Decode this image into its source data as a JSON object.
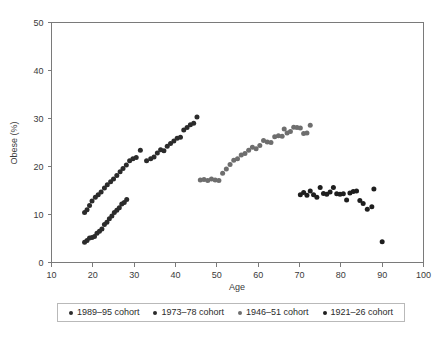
{
  "chart_data": {
    "type": "scatter",
    "title": "",
    "xlabel": "Age",
    "ylabel": "Obese (%)",
    "xlim": [
      10,
      100
    ],
    "ylim": [
      0,
      50
    ],
    "xticks": [
      10,
      20,
      30,
      40,
      50,
      60,
      70,
      80,
      90,
      100
    ],
    "yticks": [
      0,
      10,
      20,
      30,
      40,
      50
    ],
    "grid": false,
    "legend_position": "bottom",
    "series": [
      {
        "name": "1989–95 cohort",
        "color": "#2b2b2b",
        "points": [
          [
            18.0,
            4.2
          ],
          [
            18.6,
            4.6
          ],
          [
            19.2,
            5.1
          ],
          [
            19.8,
            5.2
          ],
          [
            20.4,
            5.4
          ],
          [
            21.0,
            6.1
          ],
          [
            21.6,
            6.5
          ],
          [
            22.2,
            7.0
          ],
          [
            22.8,
            7.9
          ],
          [
            23.4,
            8.4
          ],
          [
            24.0,
            9.1
          ],
          [
            24.6,
            9.7
          ],
          [
            25.2,
            10.4
          ],
          [
            25.8,
            10.9
          ],
          [
            26.4,
            11.4
          ],
          [
            27.0,
            12.2
          ],
          [
            27.6,
            12.5
          ],
          [
            28.2,
            13.1
          ]
        ]
      },
      {
        "name": "1973–78 cohort",
        "color": "#2b2b2b",
        "points": [
          [
            18.0,
            10.4
          ],
          [
            18.6,
            11.0
          ],
          [
            19.2,
            11.9
          ],
          [
            19.8,
            12.8
          ],
          [
            20.6,
            13.6
          ],
          [
            21.3,
            14.1
          ],
          [
            22.0,
            14.7
          ],
          [
            22.8,
            15.5
          ],
          [
            23.5,
            16.2
          ],
          [
            24.3,
            16.8
          ],
          [
            25.0,
            17.4
          ],
          [
            25.8,
            18.1
          ],
          [
            26.6,
            18.9
          ],
          [
            27.3,
            19.6
          ],
          [
            28.1,
            20.3
          ],
          [
            28.9,
            21.2
          ],
          [
            29.7,
            21.6
          ],
          [
            30.5,
            21.9
          ],
          [
            31.5,
            23.4
          ],
          [
            33.0,
            21.2
          ],
          [
            34.0,
            21.6
          ],
          [
            34.8,
            22.0
          ],
          [
            35.6,
            22.8
          ],
          [
            36.4,
            23.5
          ],
          [
            37.2,
            23.3
          ],
          [
            38.0,
            24.2
          ],
          [
            38.8,
            24.8
          ],
          [
            39.6,
            25.3
          ],
          [
            40.4,
            25.9
          ],
          [
            41.2,
            26.1
          ],
          [
            42.0,
            27.6
          ],
          [
            42.8,
            28.1
          ],
          [
            43.6,
            28.7
          ],
          [
            44.4,
            29.0
          ],
          [
            45.2,
            30.3
          ]
        ]
      },
      {
        "name": "1946–51 cohort",
        "color": "#6e6e6e",
        "points": [
          [
            46.0,
            17.2
          ],
          [
            46.9,
            17.3
          ],
          [
            47.8,
            17.1
          ],
          [
            48.7,
            17.4
          ],
          [
            49.6,
            17.2
          ],
          [
            50.5,
            17.1
          ],
          [
            51.4,
            18.6
          ],
          [
            52.3,
            19.5
          ],
          [
            53.2,
            20.4
          ],
          [
            54.1,
            21.3
          ],
          [
            55.0,
            21.6
          ],
          [
            55.9,
            22.4
          ],
          [
            56.8,
            22.7
          ],
          [
            57.7,
            23.4
          ],
          [
            58.6,
            24.0
          ],
          [
            59.5,
            23.7
          ],
          [
            60.4,
            24.4
          ],
          [
            61.3,
            25.4
          ],
          [
            62.2,
            25.1
          ],
          [
            63.1,
            25.0
          ],
          [
            64.0,
            26.2
          ],
          [
            64.9,
            26.4
          ],
          [
            65.8,
            26.3
          ],
          [
            66.3,
            27.8
          ],
          [
            67.0,
            27.0
          ],
          [
            67.8,
            27.3
          ],
          [
            68.6,
            28.2
          ],
          [
            69.4,
            28.1
          ],
          [
            70.2,
            28.0
          ],
          [
            71.0,
            26.9
          ],
          [
            71.8,
            27.0
          ],
          [
            72.6,
            28.6
          ]
        ]
      },
      {
        "name": "1921–26 cohort",
        "color": "#1e1e1e",
        "points": [
          [
            70.2,
            14.1
          ],
          [
            71.0,
            14.6
          ],
          [
            71.8,
            14.0
          ],
          [
            72.6,
            14.9
          ],
          [
            73.4,
            14.1
          ],
          [
            74.2,
            13.6
          ],
          [
            75.0,
            15.6
          ],
          [
            75.8,
            14.4
          ],
          [
            76.6,
            14.2
          ],
          [
            77.4,
            14.7
          ],
          [
            78.2,
            15.6
          ],
          [
            79.0,
            14.3
          ],
          [
            79.8,
            14.2
          ],
          [
            80.6,
            14.3
          ],
          [
            81.4,
            13.0
          ],
          [
            82.2,
            14.5
          ],
          [
            83.0,
            14.8
          ],
          [
            83.8,
            14.9
          ],
          [
            84.6,
            12.9
          ],
          [
            85.4,
            12.3
          ],
          [
            86.4,
            11.1
          ],
          [
            87.5,
            11.6
          ],
          [
            88.0,
            15.3
          ],
          [
            90.0,
            4.3
          ]
        ]
      }
    ]
  }
}
